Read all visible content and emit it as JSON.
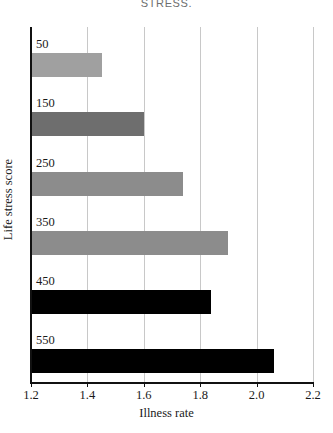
{
  "title_fragment": "STRESS.",
  "chart_data": {
    "type": "bar",
    "orientation": "horizontal",
    "title": "STRESS.",
    "xlabel": "Illness rate",
    "ylabel": "Life stress score",
    "categories": [
      "50",
      "150",
      "250",
      "350",
      "450",
      "550"
    ],
    "values": [
      1.45,
      1.6,
      1.74,
      1.9,
      1.84,
      2.06
    ],
    "xlim": [
      1.2,
      2.2
    ],
    "xticks": [
      "1.2",
      "1.4",
      "1.6",
      "1.8",
      "2.0",
      "2.2"
    ],
    "xtick_values": [
      1.2,
      1.4,
      1.6,
      1.8,
      2.0,
      2.2
    ],
    "grid": "vertical",
    "legend": "none",
    "bar_colors": [
      "#a0a0a0",
      "#6e6e6e",
      "#8c8c8c",
      "#8c8c8c",
      "#000000",
      "#000000"
    ],
    "series": [
      {
        "name": "Illness rate",
        "points": [
          {
            "category": "50",
            "value": 1.45,
            "color": "#a0a0a0"
          },
          {
            "category": "150",
            "value": 1.6,
            "color": "#6e6e6e"
          },
          {
            "category": "250",
            "value": 1.74,
            "color": "#8c8c8c"
          },
          {
            "category": "350",
            "value": 1.9,
            "color": "#8c8c8c"
          },
          {
            "category": "450",
            "value": 1.84,
            "color": "#000000"
          },
          {
            "category": "550",
            "value": 2.06,
            "color": "#000000"
          }
        ]
      }
    ],
    "axis_color": "#111111",
    "grid_color": "#c8c8c8",
    "background": "#ffffff"
  }
}
